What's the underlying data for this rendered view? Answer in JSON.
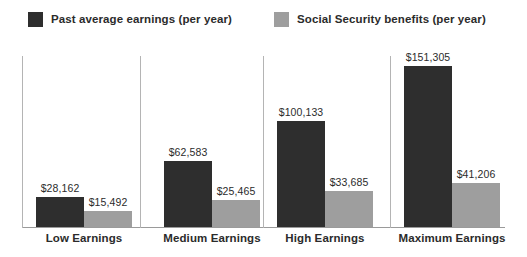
{
  "chart_data": {
    "type": "bar",
    "title": "",
    "subtitle": "",
    "xlabel": "",
    "ylabel": "",
    "grid": false,
    "legend_position": "top",
    "ylim": [
      0,
      160000
    ],
    "categories": [
      "Low Earnings",
      "Medium Earnings",
      "High Earnings",
      "Maximum Earnings"
    ],
    "series": [
      {
        "name": "Past average earnings (per year)",
        "color": "#2e2e2e",
        "values": [
          28162,
          62583,
          100133,
          151305
        ],
        "labels": [
          "$28,162",
          "$62,583",
          "$100,133",
          "$151,305"
        ]
      },
      {
        "name": "Social Security benefits (per year)",
        "color": "#9e9e9e",
        "values": [
          15492,
          25465,
          33685,
          41206
        ],
        "labels": [
          "$15,492",
          "$25,465",
          "$33,685",
          "$41,206"
        ]
      }
    ]
  },
  "legend": {
    "entries": [
      {
        "label": "Past average earnings (per year)",
        "color": "#2e2e2e"
      },
      {
        "label": "Social Security benefits (per year)",
        "color": "#9e9e9e"
      }
    ]
  },
  "axis": {
    "baseline_color": "#9a9a9a",
    "divider_color": "#b4b4b4"
  }
}
